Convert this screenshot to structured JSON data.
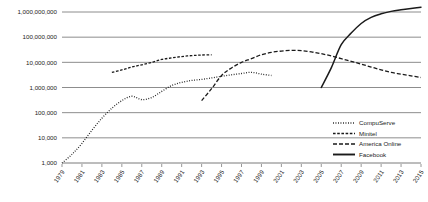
{
  "chart_data": {
    "type": "line",
    "title": "",
    "xlabel": "",
    "ylabel": "",
    "log_scale_y": true,
    "ylim": [
      1000,
      1000000000
    ],
    "xlim": [
      1979,
      2015
    ],
    "grid": true,
    "legend_position": "bottom-right",
    "y_ticks": [
      {
        "value": 1000000000,
        "label": "1,000,000,000"
      },
      {
        "value": 100000000,
        "label": "100,000,000"
      },
      {
        "value": 10000000,
        "label": "10,000,000"
      },
      {
        "value": 1000000,
        "label": "1,000,000"
      },
      {
        "value": 100000,
        "label": "100,000"
      },
      {
        "value": 10000,
        "label": "10,000"
      },
      {
        "value": 1000,
        "label": "1,000"
      }
    ],
    "x_ticks": [
      "1979",
      "1981",
      "1983",
      "1985",
      "1987",
      "1989",
      "1991",
      "1993",
      "1995",
      "1997",
      "1999",
      "2001",
      "2003",
      "2005",
      "2007",
      "2009",
      "2011",
      "2013",
      "2015"
    ],
    "series": [
      {
        "name": "CompuServe",
        "style": "dotted",
        "x": [
          1979,
          1980,
          1981,
          1982,
          1983,
          1984,
          1985,
          1986,
          1987,
          1988,
          1989,
          1990,
          1991,
          1992,
          1993,
          1994,
          1995,
          1996,
          1997,
          1998,
          1999,
          2000
        ],
        "values": [
          1000,
          2200,
          6000,
          20000,
          60000,
          150000,
          300000,
          450000,
          330000,
          400000,
          700000,
          1200000,
          1600000,
          1900000,
          2100000,
          2400000,
          2800000,
          3200000,
          3600000,
          4000000,
          3400000,
          3000000
        ]
      },
      {
        "name": "Minitel",
        "style": "dashdot",
        "x": [
          1984,
          1985,
          1986,
          1987,
          1988,
          1989,
          1990,
          1991,
          1992,
          1993,
          1994
        ],
        "values": [
          4000000,
          5000000,
          6500000,
          8000000,
          10000000,
          13000000,
          15000000,
          17000000,
          18500000,
          19500000,
          20000000
        ]
      },
      {
        "name": "America Online",
        "style": "dashed",
        "x": [
          1993,
          1994,
          1995,
          1996,
          1997,
          1998,
          1999,
          2000,
          2001,
          2002,
          2003,
          2004,
          2005,
          2006,
          2007,
          2008,
          2009,
          2010,
          2011,
          2012,
          2013,
          2014,
          2015
        ],
        "values": [
          300000,
          900000,
          3000000,
          6000000,
          10000000,
          14000000,
          20000000,
          25000000,
          28000000,
          30000000,
          29000000,
          26000000,
          22000000,
          18000000,
          14000000,
          11000000,
          8500000,
          6500000,
          5000000,
          4000000,
          3400000,
          2900000,
          2500000
        ]
      },
      {
        "name": "Facebook",
        "style": "solid",
        "x": [
          2005,
          2006,
          2007,
          2008,
          2009,
          2010,
          2011,
          2012,
          2013,
          2014,
          2015
        ],
        "values": [
          1000000,
          6000000,
          50000000,
          145000000,
          350000000,
          608000000,
          845000000,
          1060000000,
          1230000000,
          1390000000,
          1550000000
        ]
      }
    ]
  },
  "legend": {
    "items": [
      {
        "label": "CompuServe",
        "style": "dotted"
      },
      {
        "label": "Minitel",
        "style": "dashdot"
      },
      {
        "label": "America Online",
        "style": "dashed"
      },
      {
        "label": "Facebook",
        "style": "solid"
      }
    ]
  }
}
